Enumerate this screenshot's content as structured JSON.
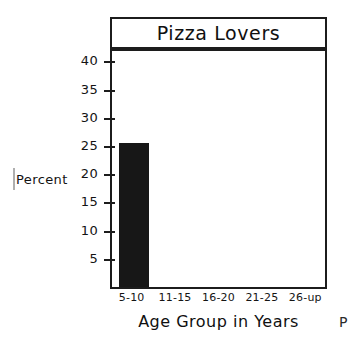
{
  "chart_data": {
    "type": "bar",
    "title": "Pizza Lovers",
    "xlabel": "Age Group in Years",
    "ylabel": "Percent",
    "categories": [
      "5-10",
      "11-15",
      "16-20",
      "21-25",
      "26-up"
    ],
    "values": [
      25.5,
      0,
      0,
      0,
      0
    ],
    "yticks": [
      5,
      10,
      15,
      20,
      25,
      30,
      35,
      40
    ],
    "ylim": [
      0,
      42
    ],
    "grid": false,
    "legend": false,
    "bar_color": "#171717",
    "frame_color": "#1c1c1c",
    "background": "#ffffff"
  },
  "artifacts": {
    "right_edge_glyph": "P"
  }
}
